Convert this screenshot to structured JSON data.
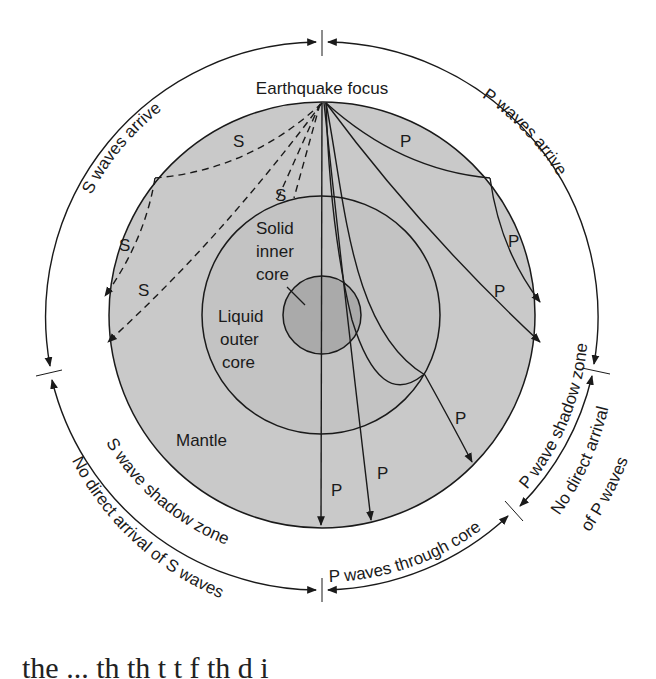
{
  "diagram": {
    "focus_label": "Earthquake focus",
    "layers": {
      "inner_core": "Solid inner core",
      "inner_core_lines": [
        "Solid",
        "inner",
        "core"
      ],
      "outer_core_lines": [
        "Liquid",
        "outer",
        "core"
      ],
      "mantle": "Mantle"
    },
    "ring_labels": {
      "s_arrive": "S waves arrive",
      "p_arrive": "P waves arrive",
      "s_shadow": "S wave shadow zone",
      "no_s": "No direct arrival of S waves",
      "p_through_core": "P waves through core",
      "p_shadow": "P wave shadow zone",
      "no_p_line1": "No direct arrival",
      "no_p_line2": "of P waves"
    },
    "wave_labels": {
      "s": "S",
      "p": "P"
    },
    "colors": {
      "mantle": "#c9c9c9",
      "outer_core": "#c2c2c2",
      "inner_core": "#a9a9a9",
      "line": "#1a1a1a",
      "background": "#ffffff"
    }
  },
  "caption_fragment": "the    ...    th  th t     t    f  th     d  i"
}
